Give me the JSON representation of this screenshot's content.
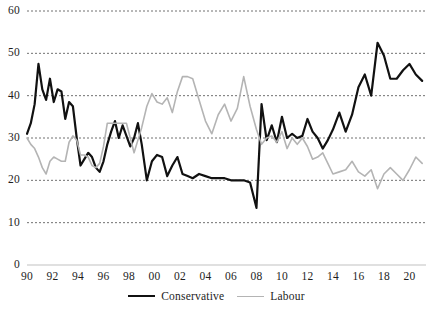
{
  "chart_data": {
    "type": "line",
    "title": "",
    "subtitle": "",
    "xlabel": "",
    "ylabel": "",
    "xlim": [
      1990,
      2021.3
    ],
    "ylim": [
      0,
      60
    ],
    "yticks": [
      0,
      10,
      20,
      30,
      40,
      50,
      60
    ],
    "ytick_labels": [
      "0",
      "10",
      "20",
      "30",
      "40",
      "50",
      "60"
    ],
    "xticks": [
      1990,
      1992,
      1994,
      1996,
      1998,
      2000,
      2002,
      2004,
      2006,
      2008,
      2010,
      2012,
      2014,
      2016,
      2018,
      2020
    ],
    "xtick_labels": [
      "90",
      "92",
      "94",
      "96",
      "98",
      "00",
      "02",
      "04",
      "06",
      "08",
      "10",
      "12",
      "14",
      "16",
      "18",
      "20"
    ],
    "grid": "horizontal-dotted",
    "legend_position": "bottom-center",
    "series": [
      {
        "name": "Conservative",
        "color": "#111111",
        "width": 2.2,
        "x": [
          1990.0,
          1990.3,
          1990.6,
          1990.9,
          1991.2,
          1991.5,
          1991.8,
          1992.1,
          1992.4,
          1992.7,
          1993.0,
          1993.3,
          1993.6,
          1993.9,
          1994.2,
          1994.5,
          1994.8,
          1995.1,
          1995.4,
          1995.7,
          1996.0,
          1996.3,
          1996.6,
          1996.9,
          1997.2,
          1997.5,
          1997.8,
          1998.1,
          1998.4,
          1998.7,
          1999.0,
          1999.4,
          1999.8,
          2000.2,
          2000.6,
          2001.0,
          2001.4,
          2001.8,
          2002.2,
          2002.6,
          2003.0,
          2003.5,
          2004.0,
          2004.5,
          2005.0,
          2005.5,
          2006.0,
          2006.5,
          2007.0,
          2007.5,
          2008.0,
          2008.4,
          2008.8,
          2009.2,
          2009.6,
          2010.0,
          2010.4,
          2010.8,
          2011.2,
          2011.6,
          2012.0,
          2012.4,
          2012.8,
          2013.2,
          2013.6,
          2014.0,
          2014.5,
          2015.0,
          2015.5,
          2016.0,
          2016.5,
          2017.0,
          2017.5,
          2018.0,
          2018.5,
          2019.0,
          2019.5,
          2020.0,
          2020.5,
          2021.0
        ],
        "y": [
          31.0,
          33.5,
          38.0,
          47.5,
          41.5,
          39.0,
          44.0,
          38.5,
          41.5,
          41.0,
          34.5,
          38.5,
          37.5,
          30.0,
          23.5,
          25.0,
          26.5,
          25.5,
          23.0,
          22.0,
          24.5,
          28.5,
          31.5,
          34.0,
          30.0,
          33.0,
          30.5,
          28.0,
          30.0,
          33.5,
          28.5,
          20.0,
          24.5,
          26.0,
          25.5,
          21.0,
          23.5,
          25.5,
          21.5,
          21.0,
          20.5,
          21.5,
          21.0,
          20.5,
          20.5,
          20.5,
          20.0,
          20.0,
          20.0,
          19.5,
          13.5,
          38.0,
          29.5,
          33.0,
          29.0,
          35.0,
          30.0,
          31.0,
          30.0,
          30.5,
          34.5,
          31.5,
          30.0,
          27.5,
          29.5,
          32.0,
          36.0,
          31.5,
          35.5,
          42.0,
          45.0,
          40.0,
          52.5,
          49.5,
          44.0,
          44.0,
          46.0,
          47.5,
          45.0,
          43.5
        ]
      },
      {
        "name": "Labour",
        "color": "#b4b4b4",
        "width": 1.6,
        "x": [
          1990.0,
          1990.3,
          1990.6,
          1990.9,
          1991.2,
          1991.5,
          1991.8,
          1992.1,
          1992.4,
          1992.7,
          1993.0,
          1993.3,
          1993.6,
          1993.9,
          1994.2,
          1994.5,
          1994.8,
          1995.1,
          1995.4,
          1995.7,
          1996.0,
          1996.3,
          1996.6,
          1996.9,
          1997.2,
          1997.5,
          1997.8,
          1998.1,
          1998.4,
          1998.7,
          1999.0,
          1999.4,
          1999.8,
          2000.2,
          2000.6,
          2001.0,
          2001.4,
          2001.8,
          2002.2,
          2002.6,
          2003.0,
          2003.5,
          2004.0,
          2004.5,
          2005.0,
          2005.5,
          2006.0,
          2006.5,
          2007.0,
          2007.5,
          2008.0,
          2008.4,
          2008.8,
          2009.2,
          2009.6,
          2010.0,
          2010.4,
          2010.8,
          2011.2,
          2011.6,
          2012.0,
          2012.4,
          2012.8,
          2013.2,
          2013.6,
          2014.0,
          2014.5,
          2015.0,
          2015.5,
          2016.0,
          2016.5,
          2017.0,
          2017.5,
          2018.0,
          2018.5,
          2019.0,
          2019.5,
          2020.0,
          2020.5,
          2021.0
        ],
        "y": [
          30.0,
          28.5,
          27.5,
          25.5,
          23.0,
          21.5,
          24.5,
          25.5,
          25.0,
          24.5,
          24.5,
          29.0,
          30.5,
          29.5,
          26.0,
          26.0,
          25.5,
          23.5,
          23.0,
          24.0,
          28.0,
          33.5,
          33.5,
          33.5,
          33.5,
          33.5,
          33.5,
          30.0,
          26.5,
          29.5,
          32.5,
          37.5,
          40.5,
          38.5,
          38.0,
          39.5,
          36.0,
          41.0,
          44.5,
          44.5,
          44.0,
          39.0,
          34.0,
          31.0,
          35.5,
          38.0,
          34.0,
          37.0,
          44.5,
          37.5,
          32.0,
          28.5,
          30.0,
          30.5,
          29.0,
          31.5,
          27.5,
          30.0,
          28.5,
          30.0,
          28.0,
          25.0,
          25.5,
          26.5,
          24.0,
          21.5,
          22.0,
          22.5,
          24.5,
          22.0,
          21.0,
          22.5,
          18.0,
          21.5,
          23.0,
          21.5,
          20.0,
          22.5,
          25.5,
          24.0
        ]
      }
    ]
  },
  "legend": {
    "conservative_label": "Conservative",
    "labour_label": "Labour"
  }
}
